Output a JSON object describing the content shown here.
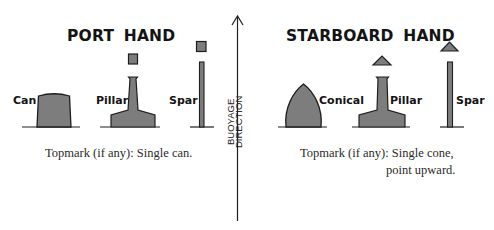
{
  "diagram": {
    "colors": {
      "fill": "#7d7d7d",
      "outline": "#1e1e1e",
      "line": "#1e1e1e",
      "background": "#ffffff"
    },
    "arrow": {
      "label_line1": "BUOYAGE",
      "label_line2": "DIRECTION",
      "direction": "up"
    },
    "port": {
      "title": "PORT HAND",
      "buoys": [
        {
          "shape": "can",
          "label": "Can",
          "topmark": "none"
        },
        {
          "shape": "pillar",
          "label": "Pillar",
          "topmark": "can"
        },
        {
          "shape": "spar",
          "label": "Spar",
          "topmark": "can"
        }
      ],
      "caption_prefix": "Topmark (if any):",
      "caption_line1": "Single can.",
      "caption_line2": ""
    },
    "starboard": {
      "title": "STARBOARD HAND",
      "buoys": [
        {
          "shape": "conical",
          "label": "Conical",
          "topmark": "none"
        },
        {
          "shape": "pillar",
          "label": "Pillar",
          "topmark": "cone-up"
        },
        {
          "shape": "spar",
          "label": "Spar",
          "topmark": "cone-up"
        }
      ],
      "caption_prefix": "Topmark (if any):",
      "caption_line1": "Single cone,",
      "caption_line2": "point upward."
    }
  }
}
